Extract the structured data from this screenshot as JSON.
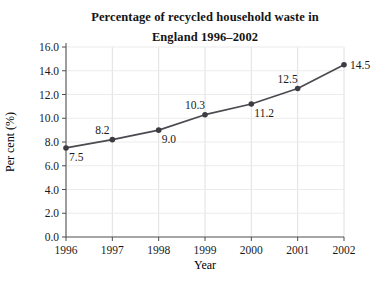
{
  "chart_data": {
    "type": "line",
    "title_line1": "Percentage of recycled household waste in",
    "title_line2": "England 1996–2002",
    "xlabel": "Year",
    "ylabel": "Per cent (%)",
    "x": [
      1996,
      1997,
      1998,
      1999,
      2000,
      2001,
      2002
    ],
    "x_tick_labels": [
      "1996",
      "1997",
      "1998",
      "1999",
      "2000",
      "2001",
      "2002"
    ],
    "values": [
      7.5,
      8.2,
      9.0,
      10.3,
      11.2,
      12.5,
      14.5
    ],
    "point_labels": [
      "7.5",
      "8.2",
      "9.0",
      "10.3",
      "11.2",
      "12.5",
      "14.5"
    ],
    "label_placement": [
      "below-right",
      "above",
      "below-right",
      "above",
      "below-right",
      "above",
      "right"
    ],
    "ylim": [
      0,
      16
    ],
    "ytick_step": 2,
    "y_tick_labels": [
      "0.0",
      "2.0",
      "4.0",
      "6.0",
      "8.0",
      "10.0",
      "12.0",
      "14.0",
      "16.0"
    ],
    "grid": "both",
    "legend": "none",
    "colors": {
      "line": "#4a4a50",
      "marker": "#3c3c42",
      "axis": "#4d4d4d",
      "grid_vertical": "#e0e0e0",
      "grid_horizontal": "#ebebeb",
      "text": "#1a1a1a"
    }
  }
}
